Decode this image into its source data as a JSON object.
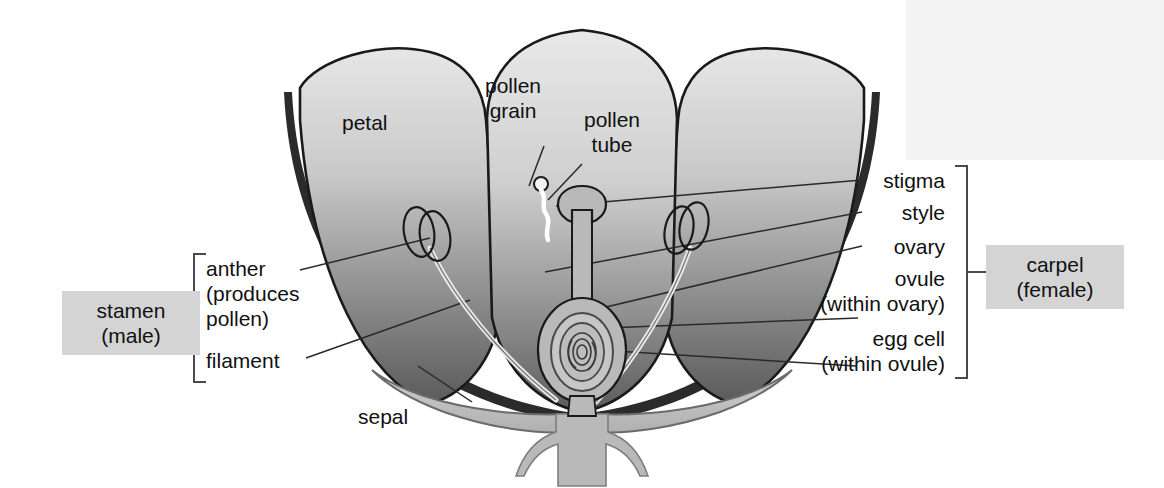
{
  "figure": {
    "kind": "flower-cross-section-diagram"
  },
  "labels": {
    "petal": "petal",
    "pollen_grain": "pollen\ngrain",
    "pollen_tube": "pollen\ntube",
    "stigma": "stigma",
    "style": "style",
    "ovary": "ovary",
    "ovule": "ovule\n(within ovary)",
    "egg_cell": "egg cell\n(within ovule)",
    "anther": "anther\n(produces\npollen)",
    "filament": "filament",
    "sepal": "sepal"
  },
  "groups": {
    "stamen": "stamen\n(male)",
    "carpel": "carpel\n(female)"
  },
  "colors": {
    "group_box_bg": "#d4d4d4",
    "text": "#111111",
    "outline": "#1a1a1a",
    "petal_light": "#e4e4e4",
    "petal_dark": "#5e5e5e",
    "petal_shadow": "#2b2b2b",
    "structure_fill": "#b9b9b9",
    "pollen_tube": "#ffffff",
    "background": "#ffffff"
  }
}
